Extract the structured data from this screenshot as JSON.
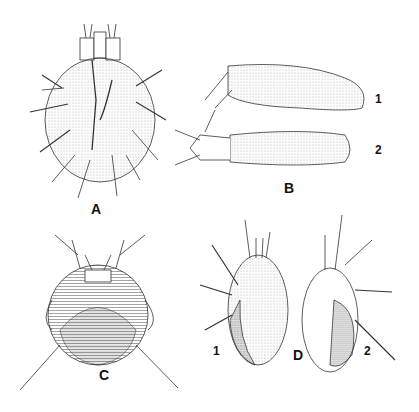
{
  "figure": {
    "panels": [
      {
        "id": "A",
        "label": "A",
        "subject": "mite-dorsal-oval"
      },
      {
        "id": "B",
        "label": "B",
        "subject": "elongated-mite",
        "sublabels": [
          "1",
          "2"
        ]
      },
      {
        "id": "C",
        "label": "C",
        "subject": "round-mite-ventral"
      },
      {
        "id": "D",
        "label": "D",
        "subject": "hairy-mite",
        "sublabels": [
          "1",
          "2"
        ]
      }
    ],
    "colors": {
      "ink": "#222222",
      "background": "#ffffff",
      "stipple": "#888888"
    }
  }
}
